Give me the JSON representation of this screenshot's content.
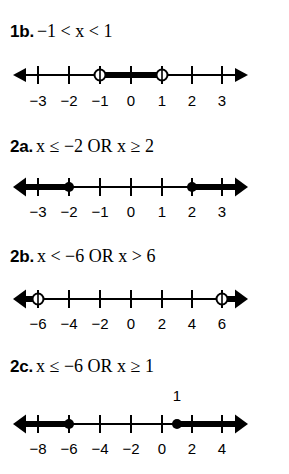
{
  "page": {
    "background": "#ffffff",
    "ink": "#000000",
    "width": 289,
    "height": 474
  },
  "problems": [
    {
      "id": "1b",
      "number_label": "1b.",
      "expression": "−1 < x < 1",
      "top": 22,
      "line_top": 58,
      "labels_top": 92,
      "axis": {
        "x_start": 13,
        "x_end": 248,
        "tick_values": [
          -3,
          -2,
          -1,
          0,
          1,
          2,
          3
        ],
        "tick_x": [
          38,
          69,
          100,
          131,
          162,
          192,
          222
        ],
        "tick_labels": [
          "−3",
          "−2",
          "−1",
          "0",
          "1",
          "2",
          "3"
        ]
      },
      "segments": [
        {
          "kind": "thick-segment",
          "from_x": 100,
          "to_x": 162
        }
      ],
      "points": [
        {
          "kind": "open",
          "x": 100,
          "value": -1
        },
        {
          "kind": "open",
          "x": 162,
          "value": 1
        }
      ],
      "rays": [],
      "above_labels": []
    },
    {
      "id": "2a",
      "number_label": "2a.",
      "expression": "x ≤ −2 OR x ≥ 2",
      "top": 137,
      "line_top": 170,
      "labels_top": 203,
      "axis": {
        "x_start": 13,
        "x_end": 248,
        "tick_values": [
          -3,
          -2,
          -1,
          0,
          1,
          2,
          3
        ],
        "tick_x": [
          38,
          69,
          100,
          131,
          162,
          192,
          222
        ],
        "tick_labels": [
          "−3",
          "−2",
          "−1",
          "0",
          "1",
          "2",
          "3"
        ]
      },
      "segments": [],
      "points": [
        {
          "kind": "closed",
          "x": 69,
          "value": -2
        },
        {
          "kind": "closed",
          "x": 192,
          "value": 2
        }
      ],
      "rays": [
        {
          "direction": "left",
          "from_x": 69
        },
        {
          "direction": "right",
          "from_x": 192
        }
      ],
      "above_labels": []
    },
    {
      "id": "2b",
      "number_label": "2b.",
      "expression": "x < −6 OR x > 6",
      "top": 247,
      "line_top": 282,
      "labels_top": 315,
      "axis": {
        "x_start": 13,
        "x_end": 248,
        "tick_values": [
          -6,
          -4,
          -2,
          0,
          2,
          4,
          6
        ],
        "tick_x": [
          38,
          69,
          100,
          131,
          162,
          192,
          222
        ],
        "tick_labels": [
          "−6",
          "−4",
          "−2",
          "0",
          "2",
          "4",
          "6"
        ]
      },
      "segments": [],
      "points": [
        {
          "kind": "open",
          "x": 38,
          "value": -6
        },
        {
          "kind": "open",
          "x": 222,
          "value": 6
        }
      ],
      "rays": [
        {
          "direction": "left",
          "from_x": 38
        },
        {
          "direction": "right",
          "from_x": 222
        }
      ],
      "above_labels": []
    },
    {
      "id": "2c",
      "number_label": "2c.",
      "expression": "x ≤ −6 OR x ≥ 1",
      "top": 357,
      "line_top": 407,
      "labels_top": 440,
      "axis": {
        "x_start": 13,
        "x_end": 248,
        "tick_values": [
          -8,
          -6,
          -4,
          -2,
          0,
          2,
          4
        ],
        "tick_x": [
          38,
          69,
          100,
          131,
          162,
          192,
          222
        ],
        "tick_labels": [
          "−8",
          "−6",
          "−4",
          "−2",
          "0",
          "2",
          "4"
        ]
      },
      "segments": [],
      "points": [
        {
          "kind": "closed",
          "x": 69,
          "value": -6
        },
        {
          "kind": "closed",
          "x": 177,
          "value": 1
        }
      ],
      "rays": [
        {
          "direction": "left",
          "from_x": 69
        },
        {
          "direction": "right",
          "from_x": 177
        }
      ],
      "above_labels": [
        {
          "text": "1",
          "x": 177,
          "top": 388
        }
      ]
    }
  ]
}
